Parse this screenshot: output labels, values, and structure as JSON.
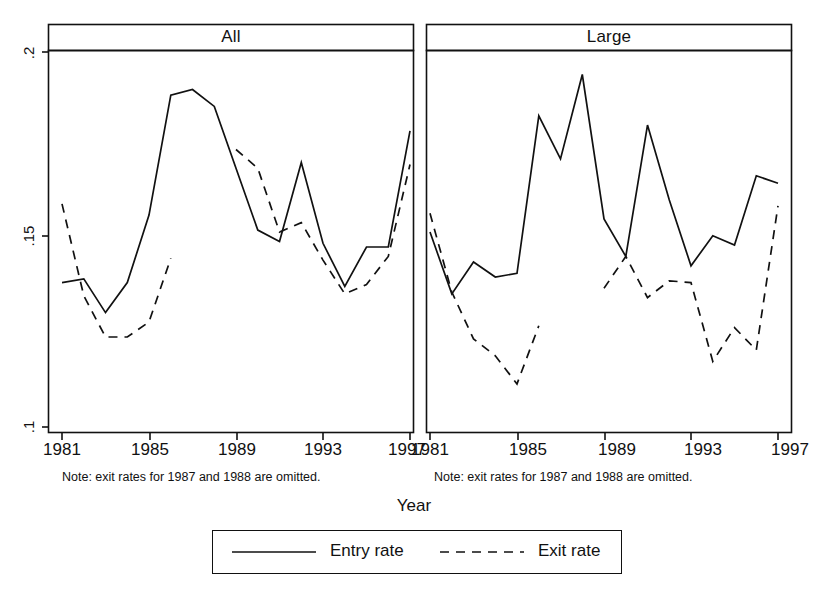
{
  "figure": {
    "xlabel": "Year",
    "note_left": "Note: exit rates for 1987 and 1988 are omitted.",
    "note_right": "Note: exit rates for 1987 and 1988 are omitted.",
    "ytick_labels": [
      ".2",
      ".15",
      ".1"
    ],
    "xtick_labels": [
      "1981",
      "1985",
      "1989",
      "1993",
      "1997"
    ],
    "panel_left_title": "All",
    "panel_right_title": "Large",
    "legend": {
      "entry_label": "Entry rate",
      "exit_label": "Exit rate"
    },
    "line_color": "#111111",
    "background": "#ffffff"
  },
  "chart_data": [
    {
      "type": "line",
      "title": "All",
      "xlabel": "Year",
      "ylabel": "",
      "xlim": [
        1981,
        1997
      ],
      "ylim": [
        0.1,
        0.205
      ],
      "yticks": [
        0.1,
        0.15,
        0.2
      ],
      "xticks": [
        1981,
        1985,
        1989,
        1993,
        1997
      ],
      "grid": false,
      "legend_position": "bottom",
      "x": [
        1981,
        1982,
        1983,
        1984,
        1985,
        1986,
        1987,
        1988,
        1989,
        1990,
        1991,
        1992,
        1993,
        1994,
        1995,
        1996,
        1997
      ],
      "series": [
        {
          "name": "Entry rate",
          "style": "solid",
          "values": [
            0.1385,
            0.1395,
            0.1305,
            0.1385,
            0.1565,
            0.1885,
            0.19,
            0.1855,
            0.169,
            0.1525,
            0.1495,
            0.1705,
            0.149,
            0.1375,
            0.148,
            0.148,
            0.179
          ]
        },
        {
          "name": "Exit rate",
          "style": "dashed",
          "values": [
            0.1595,
            0.135,
            0.124,
            0.124,
            0.128,
            0.145,
            null,
            null,
            0.174,
            0.169,
            0.152,
            0.1545,
            0.1445,
            0.1355,
            0.138,
            0.1455,
            0.17
          ]
        }
      ]
    },
    {
      "type": "line",
      "title": "Large",
      "xlabel": "Year",
      "ylabel": "",
      "xlim": [
        1981,
        1997
      ],
      "ylim": [
        0.1,
        0.205
      ],
      "yticks": [
        0.1,
        0.15,
        0.2
      ],
      "xticks": [
        1981,
        1985,
        1989,
        1993,
        1997
      ],
      "grid": false,
      "legend_position": "bottom",
      "x": [
        1981,
        1982,
        1983,
        1984,
        1985,
        1986,
        1987,
        1988,
        1989,
        1990,
        1991,
        1992,
        1993,
        1994,
        1995,
        1996,
        1997
      ],
      "series": [
        {
          "name": "Entry rate",
          "style": "solid",
          "values": [
            0.152,
            0.1355,
            0.144,
            0.14,
            0.141,
            0.183,
            0.1715,
            0.194,
            0.1555,
            0.1455,
            0.1805,
            0.1605,
            0.143,
            0.151,
            0.1485,
            0.167,
            0.165
          ]
        },
        {
          "name": "Exit rate",
          "style": "dashed",
          "values": [
            0.157,
            0.136,
            0.1235,
            0.119,
            0.1115,
            0.127,
            null,
            null,
            0.137,
            0.1455,
            0.1345,
            0.139,
            0.1385,
            0.1175,
            0.1265,
            0.1205,
            0.159
          ]
        }
      ]
    }
  ]
}
